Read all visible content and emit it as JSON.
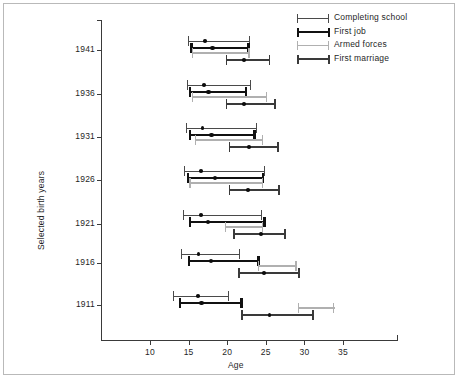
{
  "chart_data": {
    "type": "scatter",
    "subtype": "dot-and-range plot (point estimate with age-range bars)",
    "title": "",
    "xlabel": "Age",
    "ylabel": "Selected birth years",
    "xlim": [
      6,
      39
    ],
    "xticks": [
      10,
      15,
      20,
      25,
      30,
      35
    ],
    "xtick_labels": [
      "10",
      "15",
      "20",
      "25",
      "30",
      "35"
    ],
    "categories": [
      "1941",
      "1936",
      "1931",
      "1926",
      "1921",
      "1916",
      "1911"
    ],
    "grid": false,
    "legend_position": "top-right",
    "series": [
      {
        "name": "Completing school",
        "style": "thin-line",
        "color": "#4a4a4a",
        "line_width": 1,
        "points": [
          {
            "category": "1941",
            "low": 14.9,
            "median": 17.1,
            "high": 22.9
          },
          {
            "category": "1936",
            "low": 14.8,
            "median": 17.0,
            "high": 23.1
          },
          {
            "category": "1931",
            "low": 14.6,
            "median": 16.8,
            "high": 23.9
          },
          {
            "category": "1926",
            "low": 14.4,
            "median": 16.6,
            "high": 24.9
          },
          {
            "category": "1921",
            "low": 14.3,
            "median": 16.6,
            "high": 24.5
          },
          {
            "category": "1916",
            "low": 14.0,
            "median": 16.3,
            "high": 21.7
          },
          {
            "category": "1911",
            "low": 13.0,
            "median": 16.2,
            "high": 20.2
          }
        ]
      },
      {
        "name": "First job",
        "style": "thick-line",
        "color": "#111111",
        "line_width": 2.4,
        "points": [
          {
            "category": "1941",
            "low": 15.2,
            "median": 18.1,
            "high": 22.9
          },
          {
            "category": "1936",
            "low": 15.0,
            "median": 17.6,
            "high": 22.6
          },
          {
            "category": "1931",
            "low": 15.0,
            "median": 18.0,
            "high": 23.7
          },
          {
            "category": "1926",
            "low": 14.8,
            "median": 18.4,
            "high": 24.8
          },
          {
            "category": "1921",
            "low": 15.0,
            "median": 17.5,
            "high": 25.0
          },
          {
            "category": "1916",
            "low": 14.9,
            "median": 17.9,
            "high": 24.2
          },
          {
            "category": "1911",
            "low": 13.7,
            "median": 16.7,
            "high": 22.0
          }
        ]
      },
      {
        "name": "Armed forces",
        "style": "light-line",
        "color": "#b0b0b0",
        "line_width": 1.2,
        "points": [
          {
            "category": "1941",
            "low": 15.4,
            "median": null,
            "high": 22.9
          },
          {
            "category": "1936",
            "low": 15.4,
            "median": null,
            "high": 25.2
          },
          {
            "category": "1931",
            "low": 15.8,
            "median": null,
            "high": 24.6
          },
          {
            "category": "1926",
            "low": 15.1,
            "median": null,
            "high": 24.7
          },
          {
            "category": "1921",
            "low": 19.7,
            "median": null,
            "high": 24.6
          },
          {
            "category": "1916",
            "low": 24.0,
            "median": null,
            "high": 29.0
          },
          {
            "category": "1911",
            "low": 29.2,
            "median": null,
            "high": 33.9
          }
        ]
      },
      {
        "name": "First marriage",
        "style": "medium-line",
        "color": "#3a3a3a",
        "line_width": 1.6,
        "points": [
          {
            "category": "1941",
            "low": 19.8,
            "median": 22.2,
            "high": 25.6
          },
          {
            "category": "1936",
            "low": 19.8,
            "median": 22.2,
            "high": 26.3
          },
          {
            "category": "1931",
            "low": 20.2,
            "median": 22.8,
            "high": 26.7
          },
          {
            "category": "1926",
            "low": 20.2,
            "median": 22.7,
            "high": 26.8
          },
          {
            "category": "1921",
            "low": 20.8,
            "median": 24.4,
            "high": 27.6
          },
          {
            "category": "1916",
            "low": 21.4,
            "median": 24.8,
            "high": 29.4
          },
          {
            "category": "1911",
            "low": 21.8,
            "median": 25.5,
            "high": 31.2
          }
        ]
      }
    ]
  },
  "axes": {
    "x_title": "Age",
    "y_title": "Selected birth years"
  },
  "legend": {
    "items": [
      {
        "label": "Completing school"
      },
      {
        "label": "First job"
      },
      {
        "label": "Armed forces"
      },
      {
        "label": "First marriage"
      }
    ]
  }
}
